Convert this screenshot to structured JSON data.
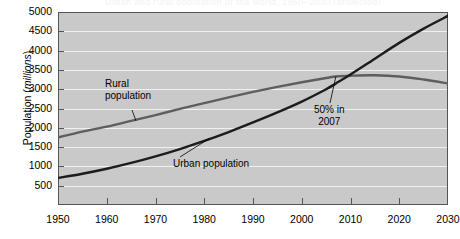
{
  "figure": {
    "title_remnant": "Urban and rural population of the world, 1950–2030 (projected)"
  },
  "chart_data": {
    "type": "line",
    "title": "",
    "xlabel": "",
    "ylabel": "Population (millions)",
    "ylabel_plain": "Population (",
    "ylabel_italic": "millions",
    "ylabel_tail": ")",
    "xlim": [
      1950,
      2030
    ],
    "ylim": [
      0,
      5000
    ],
    "grid": true,
    "grid_axis": "y",
    "legend": "none",
    "legend_position": "inline-annotations",
    "background_color": "#c9c9c9",
    "gridline_color": "#f0f0f0",
    "x_ticks": [
      1950,
      1960,
      1970,
      1980,
      1990,
      2000,
      2010,
      2020,
      2030
    ],
    "x_tick_labels": [
      "1950",
      "1960",
      "1970",
      "1980",
      "1990",
      "2000",
      "2010",
      "2020",
      "2030"
    ],
    "y_ticks": [
      500,
      1000,
      1500,
      2000,
      2500,
      3000,
      3500,
      4000,
      4500,
      5000
    ],
    "y_tick_labels": [
      "500",
      "1000",
      "1500",
      "2000",
      "2500",
      "3000",
      "3500",
      "4000",
      "4500",
      "5000"
    ],
    "x": [
      1950,
      1955,
      1960,
      1965,
      1970,
      1975,
      1980,
      1985,
      1990,
      1995,
      2000,
      2005,
      2007,
      2010,
      2015,
      2020,
      2025,
      2030
    ],
    "series": [
      {
        "name": "Rural population",
        "color": "#5e5e5e",
        "line_width": 2.4,
        "values": [
          1750,
          1900,
          2030,
          2180,
          2330,
          2490,
          2640,
          2790,
          2930,
          3060,
          3180,
          3290,
          3330,
          3350,
          3360,
          3330,
          3250,
          3150
        ]
      },
      {
        "name": "Urban population",
        "color": "#1c1c1c",
        "line_width": 2.4,
        "values": [
          700,
          810,
          940,
          1090,
          1260,
          1450,
          1660,
          1890,
          2140,
          2400,
          2680,
          3000,
          3150,
          3380,
          3790,
          4200,
          4570,
          4900
        ]
      }
    ],
    "annotations": [
      {
        "id": "rural-label",
        "text_lines": [
          "Rural",
          "population"
        ],
        "target_x": 1966,
        "target_y": 2180
      },
      {
        "id": "urban-label",
        "text_lines": [
          "Urban population"
        ],
        "target_x": 1981,
        "target_y": 1720
      },
      {
        "id": "crossover-label",
        "text_lines": [
          "50% in",
          "2007"
        ],
        "target_x": 2007,
        "target_y": 3330
      }
    ]
  }
}
